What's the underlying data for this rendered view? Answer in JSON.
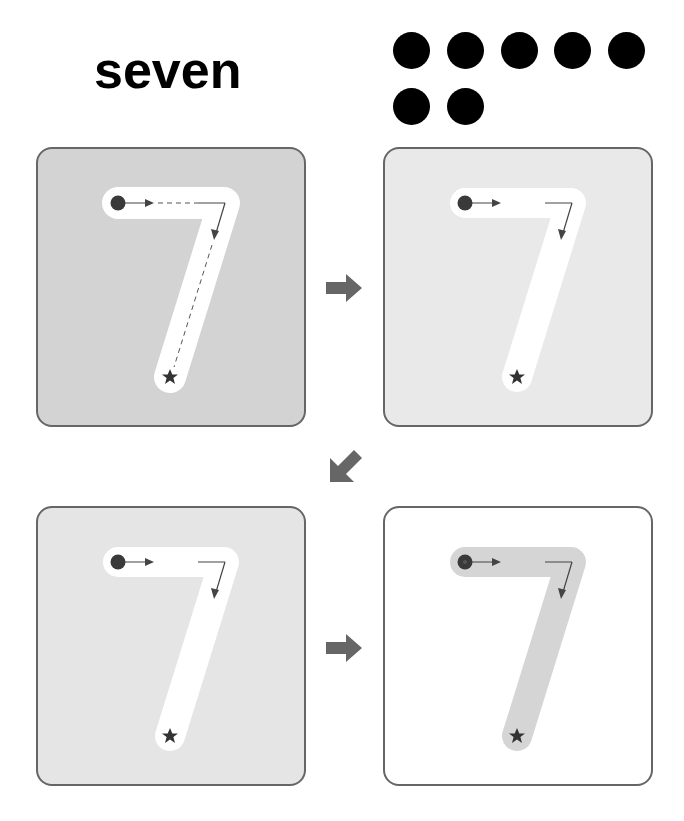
{
  "header": {
    "number_word": "seven",
    "count_dots": 7,
    "dots_per_row": 5
  },
  "colors": {
    "panel_border": "#666666",
    "panel1_bg": "#d2d2d2",
    "panel2_bg": "#e8e8e8",
    "panel3_bg": "#e4e4e4",
    "panel4_bg": "#ffffff",
    "stroke_white": "#ffffff",
    "stroke_gray": "#d4d4d4",
    "guide": "#444444",
    "arrow_fill": "#666666"
  },
  "panels": [
    {
      "step": 1,
      "label": "guided trace with dashed path",
      "dashed_guide": true
    },
    {
      "step": 2,
      "label": "trace without dashed path",
      "dashed_guide": false
    },
    {
      "step": 3,
      "label": "trace on lighter background",
      "dashed_guide": false
    },
    {
      "step": 4,
      "label": "shaded stroke on white",
      "dashed_guide": false
    }
  ],
  "icons": {
    "start": "filled-circle",
    "end": "star",
    "flow_right": "right-arrow",
    "flow_down_left": "down-left-arrow"
  }
}
